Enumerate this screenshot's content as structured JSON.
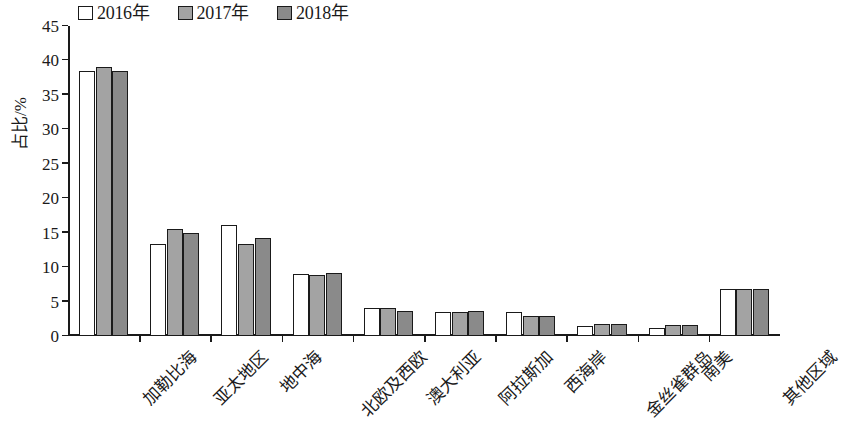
{
  "chart_data": {
    "type": "bar",
    "title": "",
    "xlabel": "",
    "ylabel": "占比/%",
    "ylim": [
      0,
      45
    ],
    "ytick_step": 5,
    "yticks": [
      "0",
      "5",
      "10",
      "15",
      "20",
      "25",
      "30",
      "35",
      "40",
      "45"
    ],
    "grid": false,
    "legend_position": "top-left",
    "categories": [
      "加勒比海",
      "亚太地区",
      "地中海",
      "北欧及西欧",
      "澳大利亚",
      "阿拉斯加",
      "西海岸",
      "金丝雀群岛",
      "南美",
      "其他区域"
    ],
    "series": [
      {
        "name": "2016年",
        "color": "#ffffff",
        "values": [
          38.4,
          13.4,
          16.1,
          9.0,
          4.1,
          3.5,
          3.5,
          1.4,
          1.1,
          6.8
        ]
      },
      {
        "name": "2017年",
        "color": "#a3a3a3",
        "values": [
          39.0,
          15.6,
          13.4,
          8.8,
          4.0,
          3.5,
          2.9,
          1.7,
          1.6,
          6.8
        ]
      },
      {
        "name": "2018年",
        "color": "#8a8a8a",
        "values": [
          38.4,
          15.0,
          14.2,
          9.2,
          3.6,
          3.7,
          2.9,
          1.7,
          1.6,
          6.8
        ]
      }
    ]
  }
}
